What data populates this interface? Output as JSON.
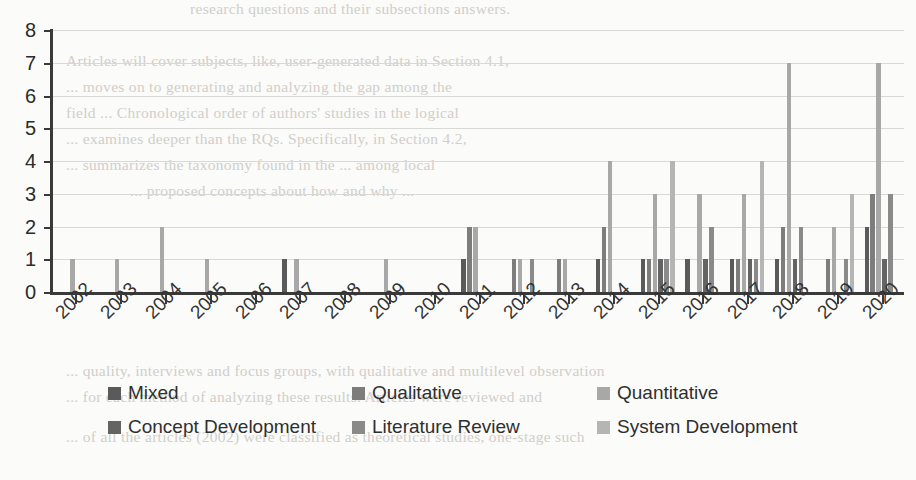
{
  "chart_data": {
    "type": "bar",
    "title": "",
    "subtitle": "",
    "xlabel": "",
    "ylabel": "",
    "grid": true,
    "legend_position": "bottom",
    "ylim": [
      0,
      8
    ],
    "yticks": [
      0,
      1,
      2,
      3,
      4,
      5,
      6,
      7,
      8
    ],
    "ytick_labels": [
      "0",
      "1",
      "2",
      "3",
      "4",
      "5",
      "6",
      "7",
      "8"
    ],
    "categories": [
      "2002",
      "2003",
      "2004",
      "2005",
      "2006",
      "2007",
      "2008",
      "2009",
      "2010",
      "2011",
      "2012",
      "2013",
      "2014",
      "2015",
      "2016",
      "2017",
      "2018",
      "2019",
      "2020"
    ],
    "series": [
      {
        "name": "Mixed",
        "color": "#5a5a5a",
        "values": [
          0,
          0,
          0,
          0,
          0,
          1,
          0,
          0,
          0,
          1,
          0,
          0,
          1,
          1,
          1,
          1,
          1,
          0,
          2
        ]
      },
      {
        "name": "Qualitative",
        "color": "#7d7d7d",
        "values": [
          0,
          0,
          0,
          0,
          0,
          0,
          0,
          0,
          0,
          2,
          1,
          1,
          2,
          1,
          0,
          1,
          2,
          1,
          3
        ]
      },
      {
        "name": "Quantitative",
        "color": "#a8a8a8",
        "values": [
          1,
          1,
          2,
          1,
          0,
          1,
          0,
          1,
          0,
          2,
          1,
          1,
          4,
          3,
          3,
          3,
          7,
          2,
          7
        ]
      },
      {
        "name": "Concept Development",
        "color": "#646464",
        "values": [
          0,
          0,
          0,
          0,
          0,
          0,
          0,
          0,
          0,
          0,
          0,
          0,
          0,
          1,
          1,
          1,
          1,
          0,
          1
        ]
      },
      {
        "name": "Literature Review",
        "color": "#8a8a8a",
        "values": [
          0,
          0,
          0,
          0,
          0,
          0,
          0,
          0,
          0,
          0,
          1,
          0,
          0,
          1,
          2,
          1,
          2,
          1,
          3
        ]
      },
      {
        "name": "System Development",
        "color": "#b5b5b5",
        "values": [
          0,
          0,
          0,
          0,
          0,
          0,
          0,
          0,
          0,
          0,
          0,
          0,
          0,
          4,
          0,
          4,
          0,
          3,
          0
        ]
      }
    ]
  },
  "legend": {
    "items": [
      {
        "label": "Mixed",
        "color": "#5a5a5a"
      },
      {
        "label": "Qualitative",
        "color": "#7d7d7d"
      },
      {
        "label": "Quantitative",
        "color": "#a8a8a8"
      },
      {
        "label": "Concept Development",
        "color": "#646464"
      },
      {
        "label": "Literature Review",
        "color": "#8a8a8a"
      },
      {
        "label": "System Development",
        "color": "#b5b5b5"
      }
    ]
  },
  "background_text": {
    "lines": [
      "research questions and their subsections answers.",
      "Articles will cover subjects, like, user-generated data in Section 4.1,",
      "... moves on to generating and analyzing the gap among the",
      "field ... Chronological order of authors' studies in the logical",
      "... examines deeper than the RQs. Specifically, in Section 4.2,",
      "... summarizes the taxonomy found in the ... among local",
      "... proposed concepts about how and why ...",
      "",
      "",
      "",
      "... quality, interviews and focus groups, with qualitative and multilevel observation",
      "... for each method of analyzing these results. Articles were reviewed and",
      "... of all the articles (2002) were classified as theoretical studies, one-stage such"
    ]
  }
}
